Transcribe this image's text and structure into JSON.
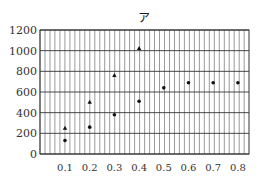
{
  "chart_data": {
    "type": "scatter",
    "title": "ア",
    "xlabel": "",
    "ylabel": "",
    "x_ticks": [
      "0.1",
      "0.2",
      "0.3",
      "0.4",
      "0.5",
      "0.6",
      "0.7",
      "0.8"
    ],
    "y_ticks": [
      "0",
      "200",
      "400",
      "600",
      "800",
      "1000",
      "1200"
    ],
    "ylim": [
      0,
      1200
    ],
    "xlim": [
      0,
      0.85
    ],
    "grid": true,
    "legend": null,
    "series": [
      {
        "name": "triangle",
        "marker": "triangle",
        "x": [
          0.1,
          0.2,
          0.3,
          0.4
        ],
        "y": [
          250,
          500,
          760,
          1020
        ]
      },
      {
        "name": "dot",
        "marker": "circle",
        "x": [
          0.1,
          0.2,
          0.3,
          0.4,
          0.5,
          0.6,
          0.7,
          0.8
        ],
        "y": [
          130,
          260,
          380,
          510,
          640,
          690,
          690,
          690
        ]
      }
    ]
  }
}
